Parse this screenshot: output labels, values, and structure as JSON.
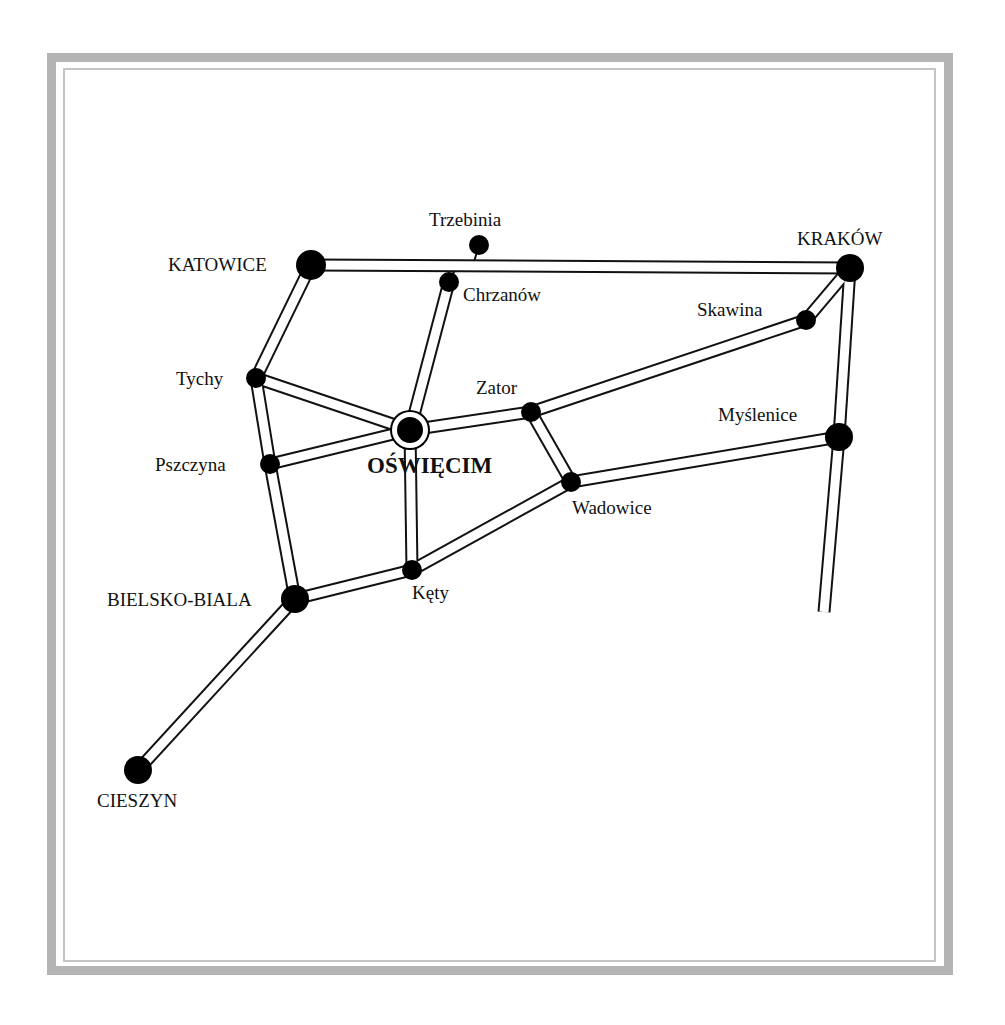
{
  "map": {
    "colors": {
      "road_outline": "#111111",
      "road_fill": "#ffffff",
      "node": "#000000",
      "frame": "#b4b4b4"
    },
    "nodes": [
      {
        "id": "katowice",
        "name": "KATOWICE",
        "x": 311,
        "y": 265,
        "r": 15,
        "type": "major",
        "label_x": 168,
        "label_y": 271,
        "anchor": "start"
      },
      {
        "id": "trzebinia",
        "name": "Trzebinia",
        "x": 479,
        "y": 245,
        "r": 10,
        "type": "minor",
        "label_x": 429,
        "label_y": 226,
        "anchor": "start"
      },
      {
        "id": "chrzanow",
        "name": "Chrzanów",
        "x": 449,
        "y": 282,
        "r": 10,
        "type": "minor",
        "label_x": 463,
        "label_y": 301,
        "anchor": "start"
      },
      {
        "id": "krakow",
        "name": "KRAKÓW",
        "x": 850,
        "y": 268,
        "r": 14,
        "type": "major",
        "label_x": 797,
        "label_y": 245,
        "anchor": "start"
      },
      {
        "id": "skawina",
        "name": "Skawina",
        "x": 806,
        "y": 320,
        "r": 10,
        "type": "minor",
        "label_x": 697,
        "label_y": 316,
        "anchor": "start"
      },
      {
        "id": "tychy",
        "name": "Tychy",
        "x": 256,
        "y": 378,
        "r": 10,
        "type": "minor",
        "label_x": 176,
        "label_y": 385,
        "anchor": "start"
      },
      {
        "id": "zator",
        "name": "Zator",
        "x": 531,
        "y": 412,
        "r": 10,
        "type": "minor",
        "label_x": 476,
        "label_y": 394,
        "anchor": "start"
      },
      {
        "id": "oswiecim",
        "name": "OŚWIĘCIM",
        "x": 410,
        "y": 430,
        "r": 13,
        "type": "capital",
        "label_x": 367,
        "label_y": 473,
        "anchor": "start"
      },
      {
        "id": "myslenice",
        "name": "Myślenice",
        "x": 839,
        "y": 437,
        "r": 14,
        "type": "major",
        "label_x": 718,
        "label_y": 421,
        "anchor": "start"
      },
      {
        "id": "pszczyna",
        "name": "Pszczyna",
        "x": 270,
        "y": 464,
        "r": 10,
        "type": "minor",
        "label_x": 155,
        "label_y": 471,
        "anchor": "start"
      },
      {
        "id": "wadowice",
        "name": "Wadowice",
        "x": 571,
        "y": 482,
        "r": 10,
        "type": "minor",
        "label_x": 572,
        "label_y": 514,
        "anchor": "start"
      },
      {
        "id": "kety",
        "name": "Kęty",
        "x": 412,
        "y": 570,
        "r": 10,
        "type": "minor",
        "label_x": 412,
        "label_y": 599,
        "anchor": "start"
      },
      {
        "id": "bielsko",
        "name": "BIELSKO-BIALA",
        "x": 295,
        "y": 599,
        "r": 14,
        "type": "major",
        "label_x": 107,
        "label_y": 606,
        "anchor": "start"
      },
      {
        "id": "cieszyn",
        "name": "CIESZYN",
        "x": 138,
        "y": 770,
        "r": 14,
        "type": "major",
        "label_x": 97,
        "label_y": 807,
        "anchor": "start"
      }
    ],
    "roads": [
      {
        "from": "katowice",
        "to": "krakow"
      },
      {
        "from": "katowice",
        "to": "tychy"
      },
      {
        "from": "tychy",
        "to": "oswiecim"
      },
      {
        "from": "tychy",
        "to": "pszczyna"
      },
      {
        "from": "pszczyna",
        "to": "oswiecim"
      },
      {
        "from": "pszczyna",
        "to": "bielsko"
      },
      {
        "from": "chrzanow",
        "to": "oswiecim"
      },
      {
        "from": "oswiecim",
        "to": "zator"
      },
      {
        "from": "zator",
        "to": "skawina"
      },
      {
        "from": "skawina",
        "to": "krakow"
      },
      {
        "from": "zator",
        "to": "wadowice"
      },
      {
        "from": "wadowice",
        "to": "myslenice"
      },
      {
        "from": "wadowice",
        "to": "kety"
      },
      {
        "from": "oswiecim",
        "to": "kety"
      },
      {
        "from": "kety",
        "to": "bielsko"
      },
      {
        "from": "bielsko",
        "to": "cieszyn"
      },
      {
        "from": "krakow",
        "to": "myslenice"
      },
      {
        "from": "myslenice",
        "to": "south_end"
      }
    ],
    "endpoints": {
      "south_end": {
        "x": 824,
        "y": 612
      }
    },
    "spurs": [
      {
        "from": "trzebinia",
        "x1": 479,
        "y1": 245,
        "x2": 474,
        "y2": 262
      },
      {
        "from": "chrzanow",
        "x1": 449,
        "y1": 282,
        "x2": 456,
        "y2": 268
      }
    ]
  }
}
